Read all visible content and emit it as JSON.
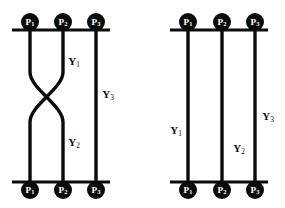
{
  "figure": {
    "type": "braid-diagram-pair",
    "background_color": "#ffffff",
    "ink_color": "#0b0b0b",
    "node_text_color": "#ffffff",
    "canvas": {
      "width": 285,
      "height": 208
    },
    "diagrams": [
      {
        "id": "left",
        "name": "braided-diagram",
        "description": "Three strands with a single crossing between strand 1 and strand 2",
        "rails": {
          "top": {
            "y": 30,
            "x_start": 12,
            "x_end": 110
          },
          "bottom": {
            "y": 182,
            "x_start": 12,
            "x_end": 110
          }
        },
        "strand_x": [
          30,
          63,
          96
        ],
        "crossing": {
          "present": true,
          "between_strands": [
            1,
            2
          ],
          "center_y": 97,
          "start_y": 72,
          "end_y": 122
        },
        "top_nodes": [
          {
            "label": "P",
            "sub": "1",
            "cx": 30,
            "cy": 22,
            "r": 9
          },
          {
            "label": "P",
            "sub": "2",
            "cx": 63,
            "cy": 22,
            "r": 9
          },
          {
            "label": "P",
            "sub": "3",
            "cx": 96,
            "cy": 22,
            "r": 9
          }
        ],
        "bottom_nodes": [
          {
            "label": "P",
            "sub": "1",
            "cx": 30,
            "cy": 190,
            "r": 9
          },
          {
            "label": "P",
            "sub": "2",
            "cx": 63,
            "cy": 190,
            "r": 9
          },
          {
            "label": "P",
            "sub": "3",
            "cx": 96,
            "cy": 190,
            "r": 9
          }
        ],
        "edge_labels": [
          {
            "label": "Y",
            "sub": "1",
            "x": 74,
            "y": 62
          },
          {
            "label": "Y",
            "sub": "2",
            "x": 74,
            "y": 143
          },
          {
            "label": "Y",
            "sub": "3",
            "x": 108,
            "y": 95
          }
        ]
      },
      {
        "id": "right",
        "name": "trivial-diagram",
        "description": "Three parallel straight strands with no crossing",
        "rails": {
          "top": {
            "y": 30,
            "x_start": 170,
            "x_end": 268
          },
          "bottom": {
            "y": 182,
            "x_start": 170,
            "x_end": 268
          }
        },
        "strand_x": [
          188,
          222,
          255
        ],
        "crossing": {
          "present": false
        },
        "top_nodes": [
          {
            "label": "P",
            "sub": "1",
            "cx": 188,
            "cy": 22,
            "r": 9
          },
          {
            "label": "P",
            "sub": "2",
            "cx": 222,
            "cy": 22,
            "r": 9
          },
          {
            "label": "P",
            "sub": "3",
            "cx": 255,
            "cy": 22,
            "r": 9
          }
        ],
        "bottom_nodes": [
          {
            "label": "P",
            "sub": "1",
            "cx": 188,
            "cy": 190,
            "r": 9
          },
          {
            "label": "P",
            "sub": "2",
            "cx": 222,
            "cy": 190,
            "r": 9
          },
          {
            "label": "P",
            "sub": "3",
            "cx": 255,
            "cy": 190,
            "r": 9
          }
        ],
        "edge_labels": [
          {
            "label": "Y",
            "sub": "1",
            "x": 176,
            "y": 131
          },
          {
            "label": "Y",
            "sub": "2",
            "x": 239,
            "y": 149
          },
          {
            "label": "Y",
            "sub": "3",
            "x": 268,
            "y": 117
          }
        ]
      }
    ]
  }
}
